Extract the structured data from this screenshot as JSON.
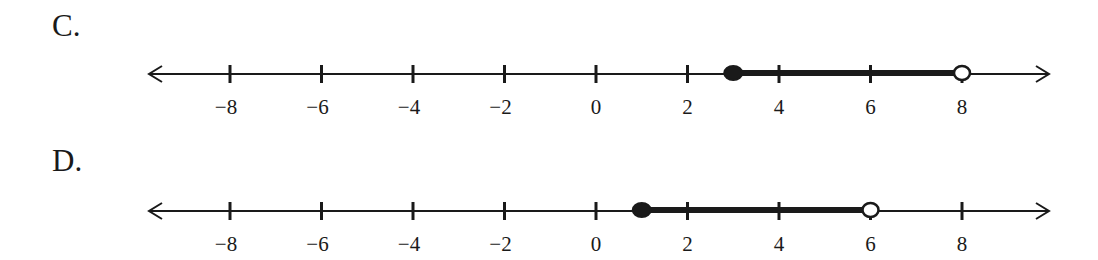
{
  "options": [
    {
      "label": "C.",
      "axis": {
        "min": -9.5,
        "max": 9.5,
        "ticks": [
          -8,
          -6,
          -4,
          -2,
          0,
          2,
          4,
          6,
          8
        ],
        "tick_labels": [
          "−8",
          "−6",
          "−4",
          "−2",
          "0",
          "2",
          "4",
          "6",
          "8"
        ],
        "arrows": "both"
      },
      "interval": {
        "start": 3,
        "end": 8,
        "start_closed": true,
        "end_closed": false
      }
    },
    {
      "label": "D.",
      "axis": {
        "min": -9.5,
        "max": 9.5,
        "ticks": [
          -8,
          -6,
          -4,
          -2,
          0,
          2,
          4,
          6,
          8
        ],
        "tick_labels": [
          "−8",
          "−6",
          "−4",
          "−2",
          "0",
          "2",
          "4",
          "6",
          "8"
        ],
        "arrows": "both"
      },
      "interval": {
        "start": 1,
        "end": 6,
        "start_closed": true,
        "end_closed": false
      }
    }
  ],
  "colors": {
    "ink": "#1a1a1a",
    "background": "#ffffff"
  }
}
